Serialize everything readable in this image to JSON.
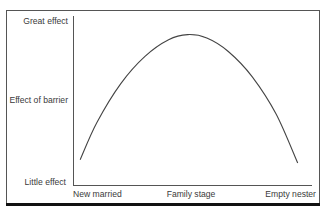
{
  "chart_data": {
    "type": "line",
    "title": "",
    "xlabel": "",
    "ylabel": "Effect of barrier",
    "x_tick_labels": [
      "New married",
      "Family stage",
      "Empty nester"
    ],
    "y_tick_labels": [
      "Little effect",
      "Effect of barrier",
      "Great effect"
    ],
    "grid": false,
    "legend": null,
    "ylim": [
      0,
      1
    ],
    "xlim": [
      0,
      1
    ],
    "series": [
      {
        "name": "Effect of barrier across family life cycle",
        "shape": "inverted-U",
        "x": [
          0.03,
          0.1,
          0.2,
          0.3,
          0.4,
          0.48,
          0.56,
          0.65,
          0.75,
          0.85,
          0.94
        ],
        "y": [
          0.15,
          0.37,
          0.6,
          0.76,
          0.86,
          0.89,
          0.87,
          0.79,
          0.64,
          0.42,
          0.13
        ]
      }
    ]
  },
  "labels": {
    "y_top": "Great effect",
    "y_mid": "Effect of barrier",
    "y_bottom": "Little effect",
    "x_left": "New married",
    "x_mid": "Family stage",
    "x_right": "Empty nester"
  }
}
